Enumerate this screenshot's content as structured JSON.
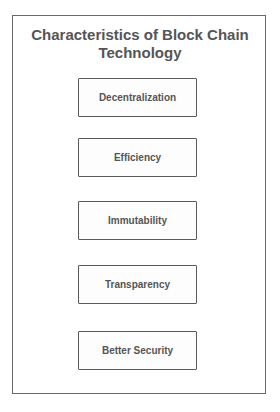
{
  "diagram": {
    "title": "Characteristics of Block Chain Technology",
    "items": [
      {
        "label": "Decentralization"
      },
      {
        "label": "Efficiency"
      },
      {
        "label": "Immutability"
      },
      {
        "label": "Transparency"
      },
      {
        "label": "Better Security"
      }
    ]
  }
}
